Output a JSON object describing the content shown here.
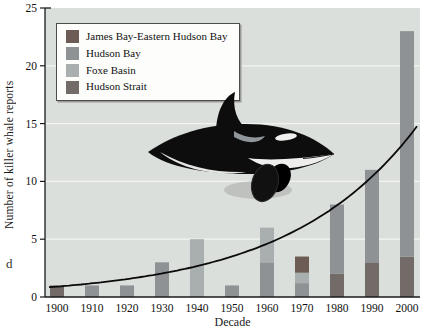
{
  "page": {
    "stray_text": "d"
  },
  "chart_data": {
    "type": "bar",
    "stacked": true,
    "title": "",
    "xlabel": "Decade",
    "ylabel": "Number of killer whale reports",
    "categories": [
      "1900",
      "1910",
      "1920",
      "1930",
      "1940",
      "1950",
      "1960",
      "1970",
      "1980",
      "1990",
      "2000"
    ],
    "series": [
      {
        "name": "Hudson Strait",
        "color": "#726b68",
        "values": [
          1,
          0,
          0,
          0,
          0,
          0,
          0,
          0,
          2,
          3,
          3.5
        ]
      },
      {
        "name": "Hudson Bay",
        "color": "#8e9295",
        "values": [
          0,
          1,
          1,
          3,
          0,
          1,
          3,
          1.2,
          6,
          8,
          19.5
        ]
      },
      {
        "name": "Foxe Basin",
        "color": "#a9aeae",
        "values": [
          0,
          0,
          0,
          0,
          5,
          0,
          3,
          0.9,
          0,
          0,
          0
        ]
      },
      {
        "name": "James Bay-Eastern Hudson Bay",
        "color": "#6d5b55",
        "values": [
          0,
          0,
          0,
          0,
          0,
          0,
          0,
          1.4,
          0,
          0,
          0
        ]
      }
    ],
    "ylim": [
      0,
      25
    ],
    "yticks": [
      0,
      5,
      10,
      15,
      20,
      25
    ],
    "gridlines": [
      5,
      10,
      15,
      20
    ],
    "grid_color": "#f3f4f1",
    "plot_bg": "#dbdfdb",
    "axis_color": "#1a1a1a",
    "trend": {
      "type": "exponential",
      "y0": 0.9,
      "rate": 0.0272,
      "x0": 1900,
      "color": "#0a0a0a",
      "end_value": 13.6
    },
    "legend_position": "upper-left"
  },
  "legend": {
    "items": [
      {
        "label": "James Bay-Eastern Hudson Bay",
        "color": "#6d5b55"
      },
      {
        "label": "Hudson Bay",
        "color": "#8e9295"
      },
      {
        "label": "Foxe Basin",
        "color": "#a9aeae"
      },
      {
        "label": "Hudson Strait",
        "color": "#726b68"
      }
    ]
  },
  "illustration": {
    "name": "killer-whale",
    "body_color": "#0d0d0d",
    "patch_color": "#f0f0ee",
    "saddle_color": "#8f979a"
  }
}
